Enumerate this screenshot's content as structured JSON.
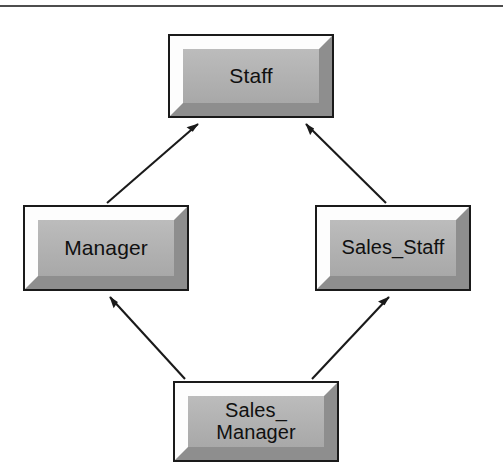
{
  "figure": {
    "top_rule": true,
    "background_color": "#ffffff",
    "box_fill_color": "#b3b3b3",
    "box_border_color": "#1a1a1a",
    "bevel_light_color": "#fdfdfd",
    "bevel_dark_color": "#8e8e8e",
    "edge_color": "#1a1a1a"
  },
  "nodes": [
    {
      "id": "staff",
      "label": "Staff"
    },
    {
      "id": "manager",
      "label": "Manager"
    },
    {
      "id": "sales_staff",
      "label": "Sales_Staff"
    },
    {
      "id": "sales_manager",
      "label": "Sales_\nManager"
    }
  ],
  "edges": [
    {
      "from": "manager",
      "to": "staff",
      "arrow": "solid-triangle"
    },
    {
      "from": "sales_staff",
      "to": "staff",
      "arrow": "solid-triangle"
    },
    {
      "from": "sales_manager",
      "to": "manager",
      "arrow": "solid-triangle"
    },
    {
      "from": "sales_manager",
      "to": "sales_staff",
      "arrow": "solid-triangle"
    }
  ]
}
